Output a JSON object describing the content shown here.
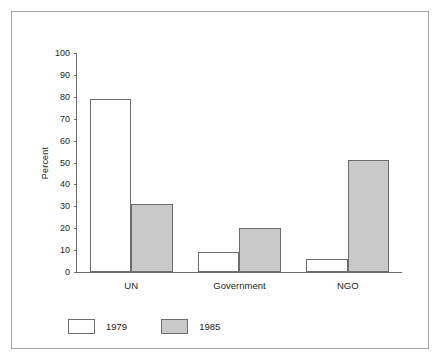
{
  "chart_data": {
    "type": "bar",
    "title": "",
    "subtitle": "",
    "xlabel": "",
    "ylabel": "Percent",
    "categories": [
      "UN",
      "Government",
      "NGO"
    ],
    "series": [
      {
        "name": "1979",
        "values": [
          79,
          9,
          6
        ],
        "color": "#ffffff"
      },
      {
        "name": "1985",
        "values": [
          31,
          20,
          51
        ],
        "color": "#c9c9c9"
      }
    ],
    "ylim": [
      0,
      100
    ],
    "yticks": [
      0,
      10,
      20,
      30,
      40,
      50,
      60,
      70,
      80,
      90,
      100
    ],
    "grid": false,
    "legend_position": "bottom-left",
    "annotations": []
  },
  "legend": {
    "items": [
      {
        "label": "1979",
        "swatch": "white-square"
      },
      {
        "label": "1985",
        "swatch": "gray-square"
      }
    ]
  },
  "colors": {
    "series_1979_fill": "#ffffff",
    "series_1985_fill": "#c9c9c9",
    "bar_stroke": "#6d6d6d",
    "axis": "#6d6d6d",
    "frame": "#a7a7a7",
    "text": "#231f20",
    "background": "#ffffff"
  }
}
